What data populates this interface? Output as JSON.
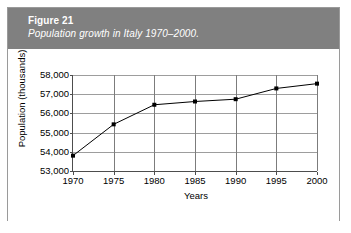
{
  "figure": {
    "number_label": "Figure 21",
    "caption": "Population growth in Italy 1970–2000.",
    "banner_color": "#808080",
    "border_color": "#9a9a9a"
  },
  "chart_data": {
    "type": "line",
    "title": "Population growth in Italy 1970–2000.",
    "xlabel": "Years",
    "ylabel": "Population (thousands)",
    "categories": [
      "1970",
      "1975",
      "1980",
      "1985",
      "1990",
      "1995",
      "2000"
    ],
    "x": [
      1970,
      1975,
      1980,
      1985,
      1990,
      1995,
      2000
    ],
    "values": [
      53800,
      55430,
      56450,
      56620,
      56740,
      57300,
      57550
    ],
    "series": [
      {
        "name": "Population",
        "values": [
          53800,
          55430,
          56450,
          56620,
          56740,
          57300,
          57550
        ]
      }
    ],
    "ylim": [
      53000,
      58000
    ],
    "xlim": [
      1970,
      2000
    ],
    "yticks": [
      53000,
      54000,
      55000,
      56000,
      57000,
      58000
    ],
    "ytick_labels": [
      "53,000",
      "54,000",
      "55,000",
      "56,000",
      "57,000",
      "58,000"
    ],
    "xticks": [
      1970,
      1975,
      1980,
      1985,
      1990,
      1995,
      2000
    ],
    "xtick_labels": [
      "1970",
      "1975",
      "1980",
      "1985",
      "1990",
      "1995",
      "2000"
    ],
    "grid": true,
    "legend": false,
    "marker": "square",
    "line_color": "#000000",
    "marker_color": "#000000",
    "plot_background": "#ffffff"
  }
}
